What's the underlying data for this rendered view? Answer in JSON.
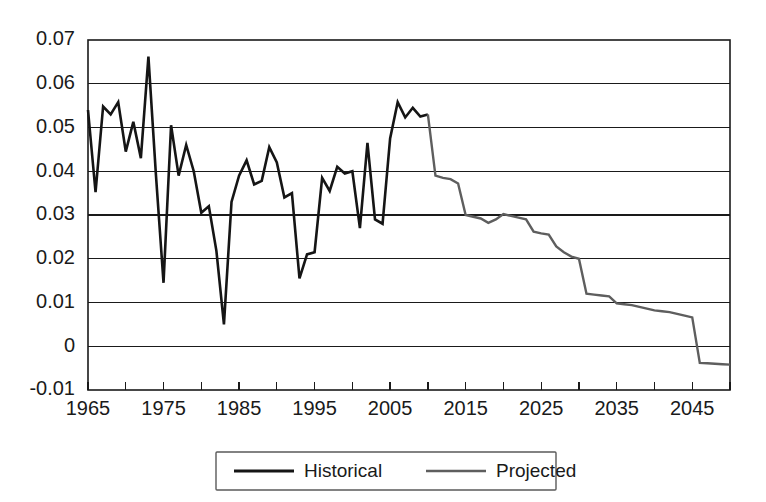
{
  "chart_data": {
    "type": "line",
    "title": "",
    "subtitle": "",
    "xlabel": "",
    "ylabel": "",
    "xlim": [
      1965,
      2050
    ],
    "ylim": [
      -0.01,
      0.07
    ],
    "grid": true,
    "grid_axis": "y",
    "legend_position": "bottom-center",
    "y_ticks": [
      -0.01,
      0,
      0.01,
      0.02,
      0.03,
      0.04,
      0.05,
      0.06,
      0.07
    ],
    "y_tick_labels": [
      "-0.01",
      "0",
      "0.01",
      "0.02",
      "0.03",
      "0.04",
      "0.05",
      "0.06",
      "0.07"
    ],
    "x_ticks": [
      1965,
      1970,
      1975,
      1980,
      1985,
      1990,
      1995,
      2000,
      2005,
      2010,
      2015,
      2020,
      2025,
      2030,
      2035,
      2040,
      2045,
      2050
    ],
    "x_tick_labels_major": [
      "1965",
      "1975",
      "1985",
      "1995",
      "2005",
      "2015",
      "2025",
      "2035",
      "2045"
    ],
    "x_ticks_major": [
      1965,
      1975,
      1985,
      1995,
      2005,
      2015,
      2025,
      2035,
      2045
    ],
    "series": [
      {
        "name": "Historical",
        "color": "#151515",
        "width": 2.6,
        "x": [
          1965,
          1966,
          1967,
          1968,
          1969,
          1970,
          1971,
          1972,
          1973,
          1974,
          1975,
          1976,
          1977,
          1978,
          1979,
          1980,
          1981,
          1982,
          1983,
          1984,
          1985,
          1986,
          1987,
          1988,
          1989,
          1990,
          1991,
          1992,
          1993,
          1994,
          1995,
          1996,
          1997,
          1998,
          1999,
          2000,
          2001,
          2002,
          2003,
          2004,
          2005,
          2006,
          2007,
          2008,
          2009,
          2010
        ],
        "values": [
          0.054,
          0.0352,
          0.0548,
          0.053,
          0.0558,
          0.0445,
          0.0513,
          0.043,
          0.0662,
          0.039,
          0.0145,
          0.0505,
          0.039,
          0.046,
          0.04,
          0.0305,
          0.032,
          0.0218,
          0.005,
          0.033,
          0.039,
          0.0425,
          0.037,
          0.0378,
          0.0455,
          0.042,
          0.034,
          0.035,
          0.0155,
          0.021,
          0.0215,
          0.0385,
          0.0355,
          0.041,
          0.0395,
          0.04,
          0.027,
          0.0465,
          0.029,
          0.028,
          0.0475,
          0.0558,
          0.0523,
          0.0545,
          0.0525,
          0.053
        ]
      },
      {
        "name": "Projected",
        "color": "#5e5e5e",
        "width": 2.4,
        "x": [
          2010,
          2011,
          2012,
          2013,
          2014,
          2015,
          2016,
          2017,
          2018,
          2019,
          2020,
          2021,
          2022,
          2023,
          2024,
          2025,
          2026,
          2027,
          2028,
          2029,
          2030,
          2031,
          2032,
          2033,
          2034,
          2035,
          2036,
          2037,
          2038,
          2039,
          2040,
          2041,
          2042,
          2043,
          2044,
          2045,
          2046,
          2047,
          2048,
          2049,
          2050
        ],
        "values": [
          0.053,
          0.039,
          0.0385,
          0.0382,
          0.0372,
          0.03,
          0.0296,
          0.0292,
          0.0282,
          0.029,
          0.0302,
          0.0298,
          0.0294,
          0.029,
          0.0262,
          0.0258,
          0.0255,
          0.0228,
          0.0215,
          0.0205,
          0.02,
          0.012,
          0.0118,
          0.0116,
          0.0114,
          0.0098,
          0.0096,
          0.0094,
          0.009,
          0.0086,
          0.0082,
          0.008,
          0.0078,
          0.0074,
          0.007,
          0.0066,
          -0.0038,
          -0.0039,
          -0.004,
          -0.0041,
          -0.0042
        ]
      }
    ]
  },
  "legend": {
    "items": [
      {
        "label": "Historical",
        "color": "#151515",
        "width": 2.8
      },
      {
        "label": "Projected",
        "color": "#5e5e5e",
        "width": 2.4
      }
    ]
  }
}
